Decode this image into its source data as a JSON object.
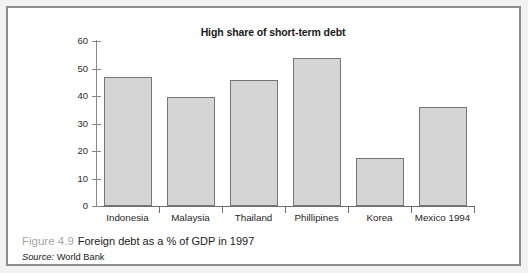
{
  "figure": {
    "number_label": "Figure 4.9",
    "caption": "Foreign debt as a % of GDP in 1997",
    "source_label": "Source:",
    "source_value": "World Bank"
  },
  "colors": {
    "bar_fill": "#d5d5d5",
    "bar_border": "#767676",
    "axis": "#6e6e6e",
    "frame": "#8c8c8c",
    "figure_number_text": "#a6a6a6"
  },
  "chart_data": {
    "type": "bar",
    "title": "High share of short-term debt",
    "xlabel": "",
    "ylabel": "",
    "ylim": [
      0,
      60
    ],
    "yticks": [
      0,
      10,
      20,
      30,
      40,
      50,
      60
    ],
    "ytick_labels": [
      "0",
      "10",
      "20",
      "30",
      "40",
      "50",
      "60"
    ],
    "grid": false,
    "legend": false,
    "categories": [
      "Indonesia",
      "Malaysia",
      "Thailand",
      "Phillipines",
      "Korea",
      "Mexico 1994"
    ],
    "values": [
      47,
      39.5,
      46,
      54,
      17.5,
      36
    ]
  }
}
